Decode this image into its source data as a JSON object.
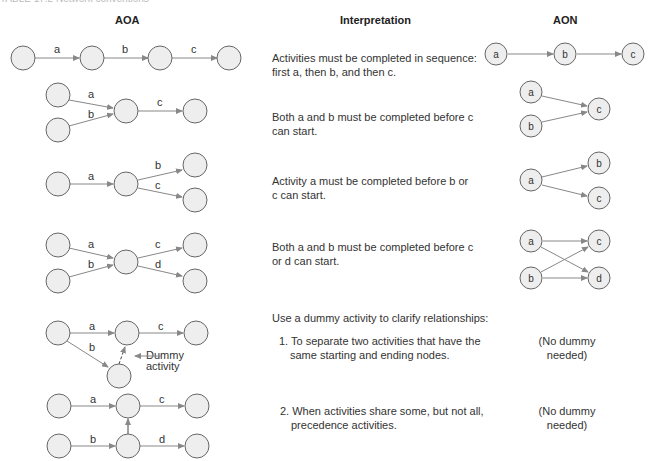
{
  "caption": "TABLE 17.2 Network conventions",
  "headers": {
    "aoa": "AOA",
    "interpretation": "Interpretation",
    "aon": "AON"
  },
  "rows": [
    {
      "interpretation": [
        "Activities must be completed in sequence:",
        "first a, then b, and then c."
      ]
    },
    {
      "interpretation": [
        "Both a and b must be completed before c",
        "can start."
      ]
    },
    {
      "interpretation": [
        "Activity a must be completed before b or",
        "c can start."
      ]
    },
    {
      "interpretation": [
        "Both a and b must be completed before c",
        "or d can start."
      ]
    },
    {
      "interpretation": [
        "Use a dummy activity to clarify relationships:"
      ]
    },
    {
      "interpretation": [
        "1. To separate two activities that have the",
        "same starting and ending nodes."
      ],
      "aon": [
        "(No dummy",
        "needed)"
      ]
    },
    {
      "interpretation": [
        "2. When activities share some, but not all,",
        "precedence activities."
      ],
      "aon": [
        "(No dummy",
        "needed)"
      ]
    }
  ],
  "dummy_label": [
    "Dummy",
    "activity"
  ],
  "activity_labels": {
    "a": "a",
    "b": "b",
    "c": "c",
    "d": "d"
  },
  "colors": {
    "node_fill": "#eeeeee",
    "node_stroke": "#666666",
    "edge": "#888888",
    "text": "#333333"
  }
}
